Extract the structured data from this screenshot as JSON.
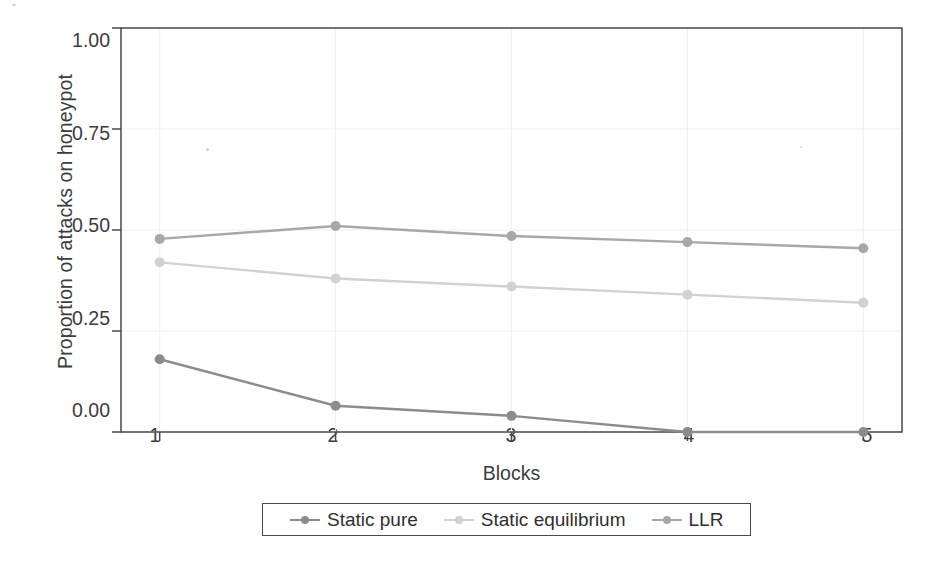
{
  "chart_data": {
    "type": "line",
    "title": "",
    "subtitle": "",
    "xlabel": "Blocks",
    "ylabel": "Proportion of attacks on honeypot",
    "x": [
      1,
      2,
      3,
      4,
      5
    ],
    "categories": [
      "1",
      "2",
      "3",
      "4",
      "5"
    ],
    "xtick_labels": [
      "1",
      "2",
      "3",
      "4",
      "5"
    ],
    "ytick_labels": [
      "0.00",
      "0.25",
      "0.50",
      "0.75",
      "1.00"
    ],
    "ytick_values": [
      0.0,
      0.25,
      0.5,
      0.75,
      1.0
    ],
    "xlim": [
      0.78,
      5.22
    ],
    "ylim": [
      0.0,
      1.0
    ],
    "grid": true,
    "grid_color": "#f0f0f0",
    "legend_position": "below-center",
    "marker": "circle",
    "series": [
      {
        "name": "Static pure",
        "color": "#8c8c8c",
        "values": [
          0.18,
          0.065,
          0.04,
          0.0,
          0.0
        ]
      },
      {
        "name": "Static equilibrium",
        "color": "#d2d2d2",
        "values": [
          0.42,
          0.38,
          0.36,
          0.34,
          0.32
        ]
      },
      {
        "name": "LLR",
        "color": "#a8a8a8",
        "values": [
          0.478,
          0.51,
          0.485,
          0.47,
          0.455
        ]
      }
    ]
  },
  "legend": {
    "entries": [
      {
        "label": "Static pure",
        "color": "#8c8c8c"
      },
      {
        "label": "Static equilibrium",
        "color": "#d2d2d2"
      },
      {
        "label": "LLR",
        "color": "#a8a8a8"
      }
    ]
  },
  "axes": {
    "frame_color": "#4a4a4a",
    "tick_color": "#4a4a4a",
    "text_color": "#3c3c3c"
  }
}
